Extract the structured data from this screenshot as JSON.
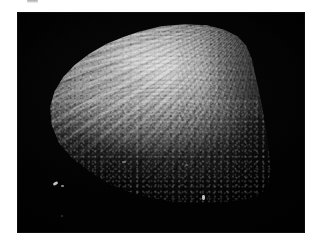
{
  "page": {
    "background_color": "#ffffff",
    "width": 323,
    "height": 246
  },
  "top_artifact": {
    "name": "cropped-mark",
    "description": "faint grey mark clipped by the top edge of the page",
    "color": "#c8c8c8"
  },
  "photo": {
    "caption": "",
    "alt": "Grayscale photomicrograph of a bivalve shell valve on a black background",
    "background_color": "#030303",
    "frame": {
      "x": 17,
      "y": 12,
      "width": 288,
      "height": 221
    }
  },
  "specimen": {
    "label": "",
    "subject": "bivalve shell valve",
    "surface": "radial ribs with concentric growth lines",
    "highlight_color": "#d2d2d2",
    "midtone_color": "#9c9c9c",
    "shadow_color": "#1a1a1a",
    "umbo_position": "upper-right",
    "illumination": "bright upper dome fading to black toward the lower-left margin"
  },
  "flecks": [
    {
      "name": "fleck-a",
      "color": "#d8d8d8"
    },
    {
      "name": "fleck-b",
      "color": "#9a9a9a"
    },
    {
      "name": "fleck-c",
      "color": "#c6c6c6"
    },
    {
      "name": "fleck-d",
      "color": "#8a8a8a"
    },
    {
      "name": "fleck-e",
      "color": "#7d7d7d"
    },
    {
      "name": "fleck-f",
      "color": "#5a5a5a"
    }
  ]
}
